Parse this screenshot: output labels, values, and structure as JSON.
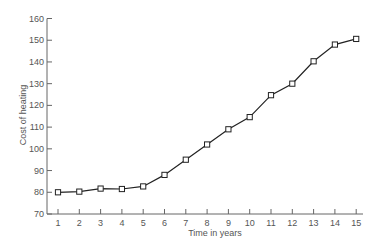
{
  "chart_data": {
    "type": "line",
    "title": "",
    "xlabel": "Time in years",
    "ylabel": "Cost of heating",
    "x": [
      1,
      2,
      3,
      4,
      5,
      6,
      7,
      8,
      9,
      10,
      11,
      12,
      13,
      14,
      15
    ],
    "series": [
      {
        "name": "Cost of heating",
        "values": [
          80,
          80.3,
          81.7,
          81.5,
          82.7,
          88,
          95,
          102,
          109,
          114.6,
          124.7,
          130,
          140.3,
          148,
          150.6
        ],
        "marker": "square",
        "color": "#222222"
      }
    ],
    "xticks": [
      "1",
      "2",
      "3",
      "4",
      "5",
      "6",
      "7",
      "8",
      "9",
      "10",
      "11",
      "12",
      "13",
      "14",
      "15"
    ],
    "yticks": [
      "70",
      "80",
      "90",
      "100",
      "110",
      "120",
      "130",
      "140",
      "150",
      "160"
    ],
    "ylim": [
      70,
      160
    ],
    "xlim": [
      0.5,
      15.5
    ],
    "grid": false,
    "legend": null
  }
}
